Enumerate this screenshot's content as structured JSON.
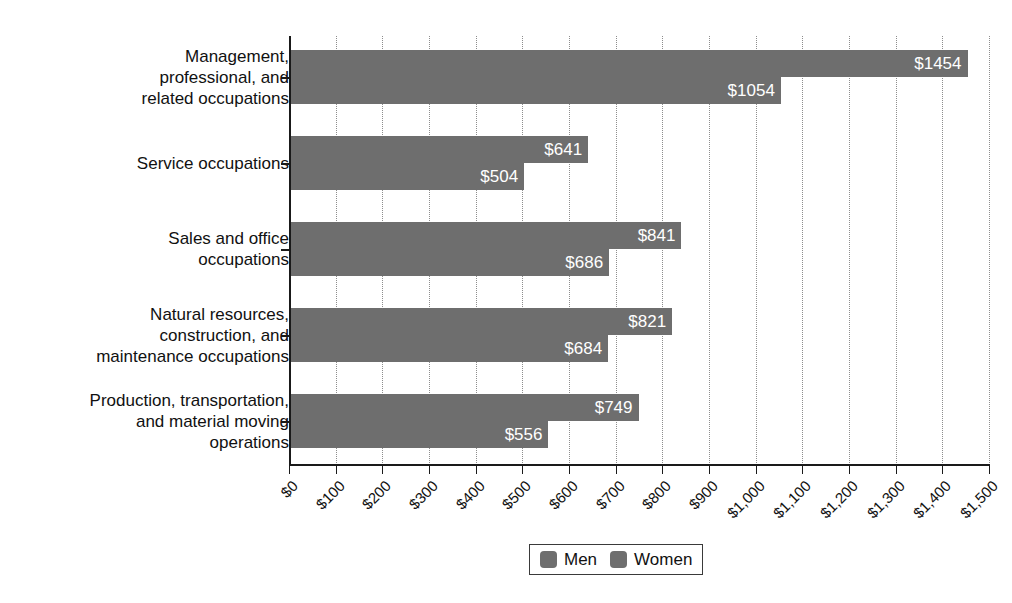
{
  "chart_data": {
    "type": "bar",
    "orientation": "horizontal",
    "title": "",
    "subtitle": "",
    "xlabel": "",
    "ylabel": "",
    "xlim": [
      0,
      1500
    ],
    "grid": true,
    "legend_position": "bottom",
    "categories": [
      "Management,\nprofessional, and\nrelated occupations",
      "Service occupations",
      "Sales and office\noccupations",
      "Natural resources,\nconstruction, and\nmaintenance occupations",
      "Production, transportation,\nand material moving\noperations"
    ],
    "series": [
      {
        "name": "Men",
        "color": "#6e6e6e",
        "values": [
          1454,
          641,
          841,
          821,
          749
        ],
        "labels": [
          "$1454",
          "$641",
          "$841",
          "$821",
          "$749"
        ]
      },
      {
        "name": "Women",
        "color": "#6e6e6e",
        "values": [
          1054,
          504,
          686,
          684,
          556
        ],
        "labels": [
          "$1054",
          "$504",
          "$686",
          "$684",
          "$556"
        ]
      }
    ],
    "xticks": [
      0,
      100,
      200,
      300,
      400,
      500,
      600,
      700,
      800,
      900,
      1000,
      1100,
      1200,
      1300,
      1400,
      1500
    ],
    "xtick_labels": [
      "$0",
      "$100",
      "$200",
      "$300",
      "$400",
      "$500",
      "$600",
      "$700",
      "$800",
      "$900",
      "$1,000",
      "$1,100",
      "$1,200",
      "$1,300",
      "$1,400",
      "$1,500"
    ]
  },
  "legend": {
    "items": [
      {
        "label": "Men",
        "color": "#6e6e6e"
      },
      {
        "label": "Women",
        "color": "#6e6e6e"
      }
    ]
  }
}
